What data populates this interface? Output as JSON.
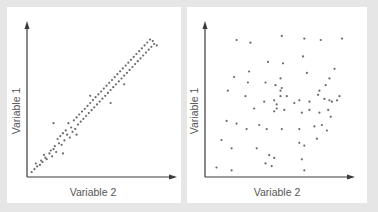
{
  "chart_data": [
    {
      "type": "scatter",
      "title": "",
      "xlabel": "Variable 2",
      "ylabel": "Variable 1",
      "grid": false,
      "legend": null,
      "description": "Strong positive linear correlation",
      "points": [
        [
          2,
          2
        ],
        [
          4,
          4
        ],
        [
          6,
          6
        ],
        [
          5,
          8
        ],
        [
          8,
          7
        ],
        [
          9,
          10
        ],
        [
          10,
          9
        ],
        [
          12,
          12
        ],
        [
          13,
          11
        ],
        [
          11,
          14
        ],
        [
          15,
          15
        ],
        [
          17,
          13
        ],
        [
          16,
          17
        ],
        [
          18,
          18
        ],
        [
          20,
          16
        ],
        [
          19,
          20
        ],
        [
          22,
          22
        ],
        [
          21,
          25
        ],
        [
          24,
          21
        ],
        [
          23,
          27
        ],
        [
          26,
          24
        ],
        [
          25,
          29
        ],
        [
          28,
          28
        ],
        [
          27,
          31
        ],
        [
          30,
          26
        ],
        [
          29,
          36
        ],
        [
          32,
          30
        ],
        [
          31,
          33
        ],
        [
          34,
          32
        ],
        [
          36,
          35
        ],
        [
          18,
          36
        ],
        [
          33,
          38
        ],
        [
          35,
          40
        ],
        [
          38,
          37
        ],
        [
          37,
          42
        ],
        [
          40,
          39
        ],
        [
          39,
          44
        ],
        [
          42,
          41
        ],
        [
          41,
          46
        ],
        [
          44,
          43
        ],
        [
          43,
          48
        ],
        [
          46,
          45
        ],
        [
          45,
          50
        ],
        [
          48,
          47
        ],
        [
          47,
          52
        ],
        [
          50,
          49
        ],
        [
          49,
          54
        ],
        [
          52,
          51
        ],
        [
          51,
          56
        ],
        [
          54,
          53
        ],
        [
          53,
          58
        ],
        [
          56,
          55
        ],
        [
          55,
          60
        ],
        [
          58,
          57
        ],
        [
          57,
          62
        ],
        [
          60,
          59
        ],
        [
          59,
          64
        ],
        [
          62,
          61
        ],
        [
          61,
          66
        ],
        [
          64,
          63
        ],
        [
          63,
          68
        ],
        [
          66,
          65
        ],
        [
          65,
          70
        ],
        [
          68,
          67
        ],
        [
          67,
          72
        ],
        [
          70,
          69
        ],
        [
          69,
          74
        ],
        [
          72,
          71
        ],
        [
          71,
          76
        ],
        [
          74,
          73
        ],
        [
          73,
          78
        ],
        [
          76,
          75
        ],
        [
          75,
          80
        ],
        [
          78,
          77
        ],
        [
          77,
          82
        ],
        [
          80,
          79
        ],
        [
          79,
          84
        ],
        [
          82,
          81
        ],
        [
          81,
          86
        ],
        [
          84,
          83
        ],
        [
          83,
          88
        ],
        [
          86,
          85
        ],
        [
          85,
          90
        ],
        [
          88,
          87
        ],
        [
          87,
          92
        ],
        [
          90,
          89
        ],
        [
          89,
          94
        ],
        [
          92,
          91
        ],
        [
          91,
          93
        ],
        [
          94,
          90
        ],
        [
          60,
          50
        ],
        [
          45,
          55
        ],
        [
          70,
          63
        ],
        [
          25,
          15
        ],
        [
          35,
          28
        ]
      ],
      "xlim": [
        0,
        100
      ],
      "ylim": [
        0,
        100
      ]
    },
    {
      "type": "scatter",
      "title": "",
      "xlabel": "Variable 2",
      "ylabel": "Variable 1",
      "grid": false,
      "legend": null,
      "description": "No correlation (random scatter)",
      "points": [
        [
          22,
          97
        ],
        [
          33,
          95
        ],
        [
          58,
          100
        ],
        [
          76,
          98
        ],
        [
          89,
          97
        ],
        [
          106,
          98
        ],
        [
          47,
          81
        ],
        [
          59,
          80
        ],
        [
          75,
          85
        ],
        [
          20,
          70
        ],
        [
          32,
          74
        ],
        [
          31,
          66
        ],
        [
          45,
          66
        ],
        [
          78,
          73
        ],
        [
          57,
          69
        ],
        [
          100,
          76
        ],
        [
          96,
          69
        ],
        [
          93,
          64
        ],
        [
          88,
          60
        ],
        [
          96,
          53
        ],
        [
          29,
          56
        ],
        [
          53,
          64
        ],
        [
          57,
          60
        ],
        [
          57,
          56
        ],
        [
          58,
          62
        ],
        [
          44,
          52
        ],
        [
          52,
          53
        ],
        [
          54,
          47
        ],
        [
          54,
          50
        ],
        [
          62,
          56
        ],
        [
          68,
          51
        ],
        [
          72,
          53
        ],
        [
          80,
          52
        ],
        [
          92,
          54
        ],
        [
          87,
          57
        ],
        [
          98,
          52
        ],
        [
          102,
          53
        ],
        [
          104,
          56
        ],
        [
          15,
          60
        ],
        [
          36,
          47
        ],
        [
          52,
          45
        ],
        [
          60,
          46
        ],
        [
          74,
          44
        ],
        [
          80,
          46
        ],
        [
          88,
          44
        ],
        [
          95,
          46
        ],
        [
          97,
          41
        ],
        [
          14,
          38
        ],
        [
          22,
          36
        ],
        [
          40,
          35
        ],
        [
          30,
          32
        ],
        [
          46,
          32
        ],
        [
          58,
          32
        ],
        [
          72,
          32
        ],
        [
          84,
          34
        ],
        [
          90,
          35
        ],
        [
          94,
          31
        ],
        [
          10,
          24
        ],
        [
          18,
          18
        ],
        [
          38,
          18
        ],
        [
          72,
          22
        ],
        [
          76,
          20
        ],
        [
          86,
          25
        ],
        [
          48,
          13
        ],
        [
          52,
          11
        ],
        [
          74,
          10
        ],
        [
          6,
          4
        ],
        [
          18,
          2
        ],
        [
          45,
          7
        ],
        [
          50,
          5
        ],
        [
          76,
          2
        ]
      ],
      "xlim": [
        0,
        110
      ],
      "ylim": [
        0,
        105
      ]
    }
  ],
  "panels": [
    {
      "xlabel": "Variable 2",
      "ylabel": "Variable 1"
    },
    {
      "xlabel": "Variable 2",
      "ylabel": "Variable 1"
    }
  ],
  "colors": {
    "background": "#e6e6e6",
    "panel": "#ffffff",
    "axis": "#3a3a3a",
    "point": "#6a6a6a",
    "label": "#555555"
  }
}
